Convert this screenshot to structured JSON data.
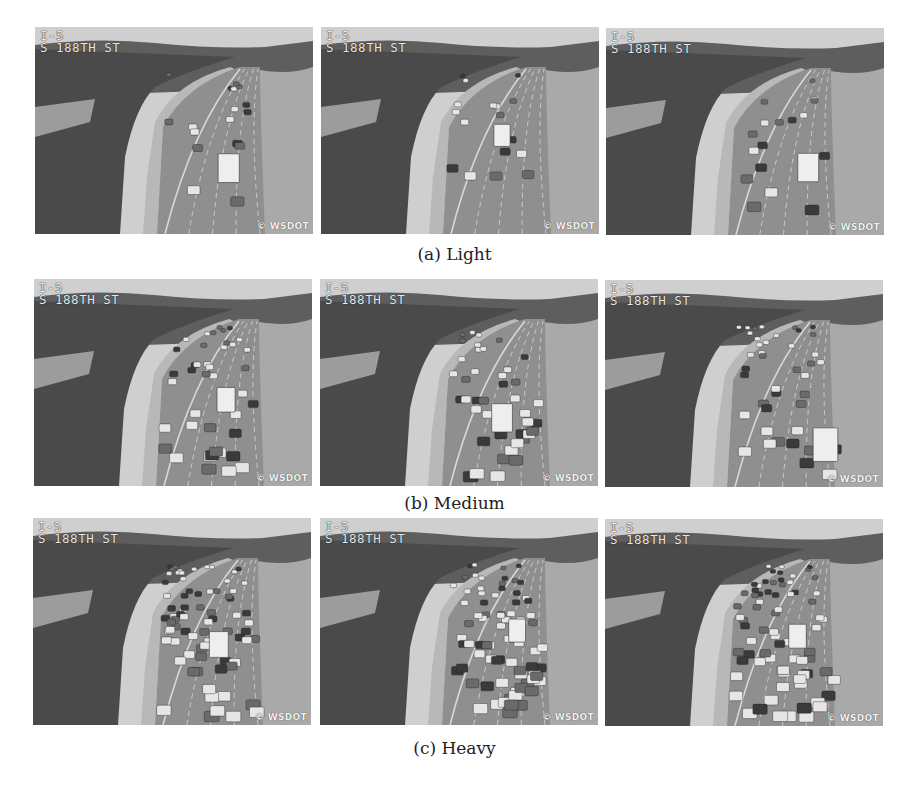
{
  "figure": {
    "rows": [
      {
        "id": "light",
        "caption": "(a) Light",
        "density": 0.15,
        "cameras": [
          {
            "route": "I-5",
            "location": "S 188TH ST",
            "credit": "© WSDOT"
          },
          {
            "route": "I-5",
            "location": "S 188TH ST",
            "credit": "© WSDOT"
          },
          {
            "route": "I-5",
            "location": "S 188TH ST",
            "credit": "© WSDOT"
          }
        ]
      },
      {
        "id": "medium",
        "caption": "(b) Medium",
        "density": 0.5,
        "cameras": [
          {
            "route": "I-5",
            "location": "S 188TH ST",
            "credit": "© WSDOT"
          },
          {
            "route": "I-5",
            "location": "S 188TH ST",
            "credit": "© WSDOT"
          },
          {
            "route": "I-5",
            "location": "S 188TH ST",
            "credit": "© WSDOT"
          }
        ]
      },
      {
        "id": "heavy",
        "caption": "(c) Heavy",
        "density": 1.0,
        "cameras": [
          {
            "route": "I-5",
            "location": "S 188TH ST",
            "credit": "© WSDOT"
          },
          {
            "route": "I-5",
            "location": "S 188TH ST",
            "credit": "© WSDOT"
          },
          {
            "route": "I-5",
            "location": "S 188TH ST",
            "credit": "© WSDOT"
          }
        ]
      }
    ]
  }
}
